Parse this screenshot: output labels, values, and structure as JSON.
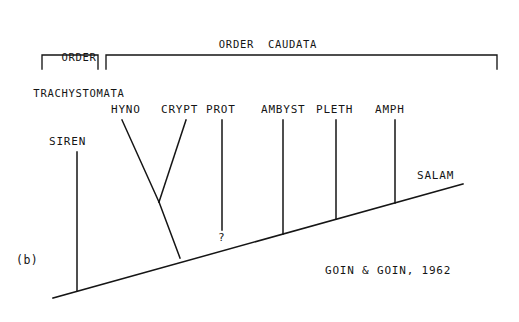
{
  "figure": {
    "panel_label": "(b)",
    "credit": "GOIN & GOIN, 1962",
    "uncertainty_marker": "?",
    "line_color": "#151515",
    "background_color": "#ffffff"
  },
  "orders": [
    {
      "name": "order-trachystomata",
      "line1": "ORDER",
      "line2": "TRACHYSTOMATA",
      "label_x": 40,
      "label_y": 29,
      "label_width": 78,
      "bracket_left": 42,
      "bracket_right": 98,
      "bracket_top": 55,
      "bracket_tick": 14
    },
    {
      "name": "order-caudata",
      "line1": "ORDER  CAUDATA",
      "line2": "",
      "label_x": 218,
      "label_y": 38,
      "label_width": 100,
      "bracket_left": 106,
      "bracket_right": 497,
      "bracket_top": 55,
      "bracket_tick": 14
    }
  ],
  "taxa": [
    {
      "name": "siren",
      "label": "SIREN",
      "label_x": 49,
      "label_y": 137,
      "line_x": 77,
      "line_top": 152,
      "line_bottom": 291
    },
    {
      "name": "hyno",
      "label": "HYNO",
      "label_x": 111,
      "label_y": 105,
      "line_x": 122,
      "line_top": 120,
      "line_bottom": 202
    },
    {
      "name": "crypt",
      "label": "CRYPT",
      "label_x": 161,
      "label_y": 105,
      "line_x": 186,
      "line_top": 120,
      "line_bottom": 202
    },
    {
      "name": "prot",
      "label": "PROT",
      "label_x": 206,
      "label_y": 105,
      "line_x": 222,
      "line_top": 120,
      "line_bottom": 230
    },
    {
      "name": "ambyst",
      "label": "AMBYST",
      "label_x": 262,
      "label_y": 105,
      "line_x": 283,
      "line_top": 120,
      "line_bottom": 254
    },
    {
      "name": "pleth",
      "label": "PLETH",
      "label_x": 317,
      "label_y": 105,
      "line_x": 336,
      "line_top": 120,
      "line_bottom": 243
    },
    {
      "name": "amph",
      "label": "AMPH",
      "label_x": 376,
      "label_y": 105,
      "line_x": 395,
      "line_top": 120,
      "line_bottom": 225
    },
    {
      "name": "salam",
      "label": "SALAM",
      "label_x": 417,
      "label_y": 171,
      "line_x": 0,
      "line_top": 0,
      "line_bottom": 0
    }
  ],
  "baseline": {
    "name": "time-axis-baseline",
    "x1": 53,
    "y1": 298,
    "x2": 463,
    "y2": 184
  },
  "clade_hyno_crypt": {
    "name": "hynobiid-cryptobranchid-clade",
    "junction_x": 159,
    "junction_y": 202,
    "stem_base_x": 180,
    "stem_base_y": 258
  },
  "question_mark": {
    "x": 218,
    "y": 233
  }
}
